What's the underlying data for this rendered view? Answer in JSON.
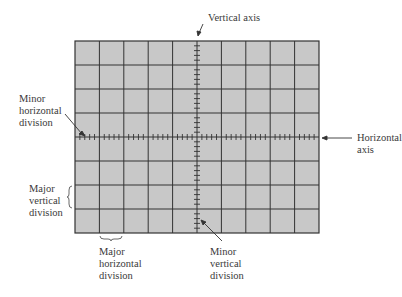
{
  "diagram": {
    "type": "oscilloscope graticule",
    "grid": {
      "columns": 10,
      "rows": 8,
      "minor_ticks_per_division": 5,
      "fill": "#c8c8c8",
      "line": "#333333"
    },
    "labels": {
      "vertical_axis": "Vertical axis",
      "horizontal_axis": "Horizontal\naxis",
      "minor_horizontal_division": "Minor\nhorizontal\ndivision",
      "major_vertical_division": "Major\nvertical\ndivision",
      "major_horizontal_division": "Major\nhorizontal\ndivision",
      "minor_vertical_division": "Minor\nvertical\ndivision"
    }
  }
}
